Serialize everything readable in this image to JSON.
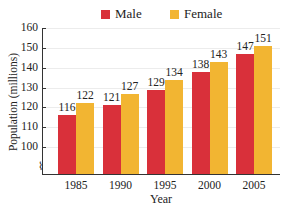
{
  "chart_data": {
    "type": "bar",
    "title": "",
    "xlabel": "Year",
    "ylabel": "Population (millions)",
    "categories": [
      "1985",
      "1990",
      "1995",
      "2000",
      "2005"
    ],
    "series": [
      {
        "name": "Male",
        "color": "#d9303a",
        "values": [
          116,
          121,
          129,
          138,
          147
        ]
      },
      {
        "name": "Female",
        "color": "#f2b532",
        "values": [
          122,
          127,
          134,
          143,
          151
        ]
      }
    ],
    "yticks": [
      100,
      110,
      120,
      130,
      140,
      150,
      160
    ],
    "ylim": [
      93,
      160
    ],
    "axis_break": true,
    "grid": true,
    "legend_position": "top"
  },
  "legend": {
    "male_label": "Male",
    "female_label": "Female"
  },
  "axes": {
    "ylabel": "Population (millions)",
    "xlabel": "Year"
  }
}
